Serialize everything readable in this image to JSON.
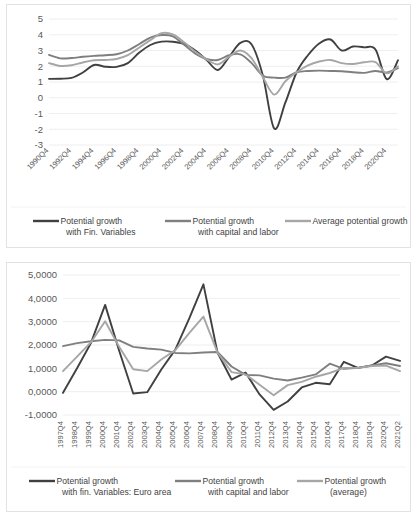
{
  "charts": [
    {
      "id": "top",
      "chart_data": {
        "type": "line",
        "title": "",
        "xlabel": "",
        "ylabel": "",
        "ylim": [
          -3,
          5
        ],
        "yticks": [
          5,
          4,
          3,
          2,
          1,
          0,
          -1,
          -2,
          -3
        ],
        "ytick_labels": [
          "5",
          "4",
          "3",
          "2",
          "1",
          "0",
          "-1",
          "-2",
          "-3"
        ],
        "grid": true,
        "legend_position": "bottom",
        "x_tick_rotation": -45,
        "categories": [
          "1990Q4",
          "1991Q4",
          "1992Q4",
          "1993Q4",
          "1994Q4",
          "1995Q4",
          "1996Q4",
          "1997Q4",
          "1998Q4",
          "1999Q4",
          "2000Q4",
          "2001Q4",
          "2002Q4",
          "2003Q4",
          "2004Q4",
          "2005Q4",
          "2006Q4",
          "2007Q4",
          "2008Q4",
          "2009Q4",
          "2010Q4",
          "2011Q4",
          "2012Q4",
          "2013Q4",
          "2014Q4",
          "2015Q4",
          "2016Q4",
          "2017Q4",
          "2018Q4",
          "2019Q4",
          "2020Q4",
          "2021Q2"
        ],
        "visible_tick_labels": [
          "1990Q4",
          "1992Q4",
          "1994Q4",
          "1996Q4",
          "1998Q4",
          "2000Q4",
          "2002Q4",
          "2004Q4",
          "2006Q4",
          "2008Q4",
          "2010Q4",
          "2012Q4",
          "2014Q4",
          "2016Q4",
          "2018Q4",
          "2020Q4"
        ],
        "series": [
          {
            "name": "Potential growth with Fin. Variables",
            "color": "#404040",
            "width": 1.9,
            "values": [
              1.2,
              1.21,
              1.26,
              1.6,
              2.08,
              1.97,
              1.96,
              2.2,
              2.85,
              3.35,
              3.56,
              3.56,
              3.42,
              3.0,
              2.4,
              1.76,
              2.6,
              3.48,
              3.38,
              1.4,
              -1.95,
              -0.3,
              1.62,
              2.7,
              3.45,
              3.7,
              3.0,
              3.25,
              3.2,
              3.06,
              1.18,
              2.38
            ]
          },
          {
            "name": "Potential growth with capital and labor",
            "color": "#7f7f7f",
            "width": 1.9,
            "values": [
              2.72,
              2.5,
              2.52,
              2.6,
              2.66,
              2.7,
              2.76,
              3.0,
              3.4,
              3.82,
              3.98,
              3.9,
              3.36,
              2.8,
              2.46,
              2.4,
              2.7,
              2.76,
              2.2,
              1.4,
              1.28,
              1.28,
              1.62,
              1.7,
              1.72,
              1.7,
              1.68,
              1.62,
              1.58,
              1.7,
              1.6,
              1.88
            ]
          },
          {
            "name": "Average potential growth",
            "color": "#a6a6a6",
            "width": 1.9,
            "values": [
              2.2,
              2.02,
              2.06,
              2.24,
              2.38,
              2.4,
              2.46,
              2.7,
              3.18,
              3.66,
              4.1,
              4.02,
              3.52,
              2.92,
              2.44,
              2.12,
              2.6,
              3.0,
              2.5,
              1.3,
              0.2,
              1.05,
              1.62,
              2.05,
              2.3,
              2.4,
              2.2,
              2.14,
              2.25,
              2.26,
              1.55,
              2.0
            ]
          }
        ]
      },
      "legend": [
        {
          "label_line1": "Potential growth",
          "label_line2": "with Fin. Variables",
          "color": "#404040"
        },
        {
          "label_line1": "Potential growth",
          "label_line2": "with capital and labor",
          "color": "#7f7f7f"
        },
        {
          "label_line1": "Average potential growth",
          "label_line2": "",
          "color": "#a6a6a6"
        }
      ]
    },
    {
      "id": "bottom",
      "chart_data": {
        "type": "line",
        "title": "",
        "xlabel": "",
        "ylabel": "",
        "ylim": [
          -1,
          5
        ],
        "yticks": [
          5,
          4,
          3,
          2,
          1,
          0,
          -1
        ],
        "ytick_labels": [
          "5,0000",
          "4,0000",
          "3,0000",
          "2,0000",
          "1,0000",
          "0,0000",
          "-1,0000"
        ],
        "grid": true,
        "legend_position": "bottom",
        "x_tick_rotation": -90,
        "categories": [
          "1997Q4",
          "1998Q4",
          "1999Q4",
          "2000Q4",
          "2001Q4",
          "2002Q4",
          "2003Q4",
          "2004Q4",
          "2005Q4",
          "2006Q4",
          "2007Q4",
          "2008Q4",
          "2009Q4",
          "2010Q4",
          "2011Q4",
          "2012Q4",
          "2013Q4",
          "2014Q4",
          "2015Q4",
          "2016Q4",
          "2017Q4",
          "2018Q4",
          "2019Q4",
          "2020Q4",
          "2021Q2"
        ],
        "series": [
          {
            "name": "Potential growth with fin. Variables: Euro area",
            "color": "#404040",
            "width": 1.9,
            "values": [
              -0.05,
              1.0,
              2.1,
              3.72,
              1.75,
              -0.08,
              -0.02,
              0.95,
              1.8,
              3.15,
              4.6,
              1.68,
              0.52,
              0.82,
              -0.12,
              -0.78,
              -0.42,
              0.18,
              0.38,
              0.32,
              1.28,
              1.02,
              1.12,
              1.5,
              1.32
            ]
          },
          {
            "name": "Potential growth with capital and labor",
            "color": "#7f7f7f",
            "width": 1.9,
            "values": [
              1.95,
              2.08,
              2.16,
              2.22,
              2.2,
              1.92,
              1.85,
              1.8,
              1.66,
              1.64,
              1.68,
              1.7,
              1.08,
              0.72,
              0.7,
              0.56,
              0.48,
              0.6,
              0.74,
              1.2,
              0.98,
              1.02,
              1.12,
              1.22,
              1.1
            ]
          },
          {
            "name": "Potential growth (average)",
            "color": "#a6a6a6",
            "width": 1.9,
            "values": [
              0.88,
              1.5,
              2.12,
              3.02,
              1.92,
              0.96,
              0.88,
              1.38,
              1.78,
              2.52,
              3.22,
              1.68,
              0.84,
              0.74,
              0.3,
              -0.15,
              0.28,
              0.42,
              0.64,
              0.8,
              1.02,
              1.02,
              1.1,
              1.12,
              0.88
            ]
          }
        ]
      },
      "legend": [
        {
          "label_line1": "Potential growth",
          "label_line2": "with fin. Variables: Euro area",
          "color": "#404040"
        },
        {
          "label_line1": "Potential growth",
          "label_line2": "with capital and labor",
          "color": "#7f7f7f"
        },
        {
          "label_line1": "Potential growth",
          "label_line2": "(average)",
          "color": "#a6a6a6"
        }
      ]
    }
  ]
}
